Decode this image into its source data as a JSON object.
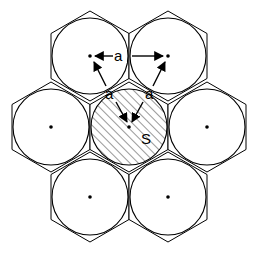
{
  "diagram": {
    "type": "hexagonal-close-packed-fibers",
    "labels": {
      "spacing_top": "a",
      "spacing_left": "a",
      "spacing_right": "a",
      "shaded_area": "S"
    },
    "cells": [
      {
        "id": "top-left",
        "cx": 90,
        "cy": 56,
        "shaded": false
      },
      {
        "id": "top-right",
        "cx": 168,
        "cy": 56,
        "shaded": false
      },
      {
        "id": "middle-left",
        "cx": 51,
        "cy": 127,
        "shaded": false
      },
      {
        "id": "center",
        "cx": 129,
        "cy": 127,
        "shaded": true
      },
      {
        "id": "middle-right",
        "cx": 207,
        "cy": 127,
        "shaded": false
      },
      {
        "id": "bottom-left",
        "cx": 90,
        "cy": 197,
        "shaded": false
      },
      {
        "id": "bottom-right",
        "cx": 168,
        "cy": 197,
        "shaded": false
      }
    ],
    "circle_radius": 38,
    "hex_circumradius": 45,
    "colors": {
      "stroke": "#000000",
      "fill": "#ffffff",
      "hatch": "#333333"
    }
  }
}
